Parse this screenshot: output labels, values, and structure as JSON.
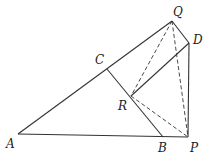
{
  "diagram": {
    "points": {
      "A": {
        "label": "A",
        "x": 18,
        "y": 134,
        "lx": 6,
        "ly": 148
      },
      "B": {
        "label": "B",
        "x": 163,
        "y": 137,
        "lx": 158,
        "ly": 152
      },
      "P": {
        "label": "P",
        "x": 188,
        "y": 137,
        "lx": 190,
        "ly": 152
      },
      "C": {
        "label": "C",
        "x": 107,
        "y": 69,
        "lx": 95,
        "ly": 64
      },
      "Q": {
        "label": "Q",
        "x": 172,
        "y": 21,
        "lx": 173,
        "ly": 16
      },
      "D": {
        "label": "D",
        "x": 189,
        "y": 43,
        "lx": 193,
        "ly": 44
      },
      "R": {
        "label": "R",
        "x": 131,
        "y": 96,
        "lx": 118,
        "ly": 110
      }
    },
    "solid_segments": [
      [
        "A",
        "Q"
      ],
      [
        "A",
        "P"
      ],
      [
        "C",
        "B"
      ],
      [
        "Q",
        "D"
      ],
      [
        "D",
        "P"
      ],
      [
        "R",
        "D"
      ]
    ],
    "dashed_segments": [
      [
        "Q",
        "R"
      ],
      [
        "Q",
        "P"
      ],
      [
        "R",
        "P"
      ]
    ]
  }
}
